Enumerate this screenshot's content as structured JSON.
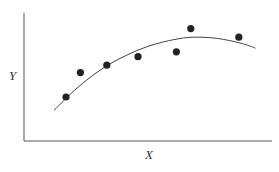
{
  "chart_data": {
    "type": "scatter",
    "title": "",
    "xlabel": "X",
    "ylabel": "Y",
    "grid": false,
    "legend": null,
    "ticks": {
      "x": [],
      "y": []
    },
    "xlim": [
      0,
      100
    ],
    "ylim": [
      0,
      100
    ],
    "series": [
      {
        "name": "observations",
        "kind": "scatter",
        "color": "#222222",
        "points": [
          {
            "x": 15,
            "y": 32
          },
          {
            "x": 21,
            "y": 52
          },
          {
            "x": 32,
            "y": 58
          },
          {
            "x": 45,
            "y": 65
          },
          {
            "x": 61,
            "y": 69
          },
          {
            "x": 67,
            "y": 88
          },
          {
            "x": 87,
            "y": 81
          }
        ]
      },
      {
        "name": "fitted curve",
        "kind": "line",
        "color": "#444444",
        "description": "concave quadratic trend line",
        "points": [
          {
            "x": 10,
            "y": 21
          },
          {
            "x": 20,
            "y": 40
          },
          {
            "x": 30,
            "y": 55
          },
          {
            "x": 40,
            "y": 66
          },
          {
            "x": 50,
            "y": 74
          },
          {
            "x": 60,
            "y": 79
          },
          {
            "x": 68,
            "y": 81
          },
          {
            "x": 78,
            "y": 80
          },
          {
            "x": 88,
            "y": 76
          },
          {
            "x": 94,
            "y": 72
          }
        ]
      }
    ]
  },
  "labels": {
    "x": "X",
    "y": "Y"
  }
}
